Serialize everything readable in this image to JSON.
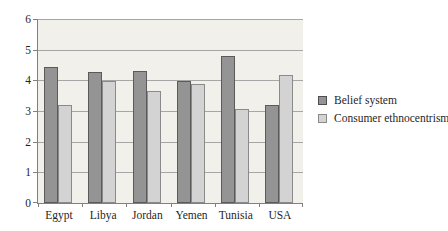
{
  "chart_data": {
    "type": "bar",
    "title": "",
    "xlabel": "",
    "ylabel": "",
    "categories": [
      "Egypt",
      "Libya",
      "Jordan",
      "Yemen",
      "Tunisia",
      "USA"
    ],
    "series": [
      {
        "name": "Belief system",
        "color": "#949494",
        "border_color": "#5a5a5a",
        "values": [
          4.43,
          4.27,
          4.29,
          3.97,
          4.8,
          3.2
        ]
      },
      {
        "name": "Consumer ethnocentrism",
        "color": "#d3d3d3",
        "border_color": "#8a8a8a",
        "values": [
          3.2,
          3.98,
          3.66,
          3.88,
          3.06,
          4.18
        ]
      }
    ],
    "ylim": [
      0,
      6
    ],
    "yticks": [
      "6",
      "5",
      "4",
      "3",
      "2",
      "1",
      "0"
    ],
    "grid": "horizontal",
    "legend_position": "right",
    "plot_background": "#f1f0eb",
    "gridline_color": "#a6a6a6",
    "axis_color": "#808080"
  }
}
